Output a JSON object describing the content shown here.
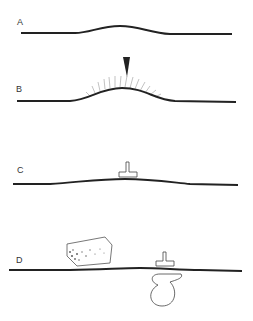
{
  "figure": {
    "panels": [
      {
        "label": "A",
        "description": "surface with smooth bump"
      },
      {
        "label": "B",
        "description": "bump with arrow and radiating lines"
      },
      {
        "label": "C",
        "description": "flattened surface with T-shaped object"
      },
      {
        "label": "D",
        "description": "surface with block, T-shaped object, and loop beneath"
      }
    ],
    "colors": {
      "line": "#222222",
      "background": "#ffffff"
    }
  }
}
